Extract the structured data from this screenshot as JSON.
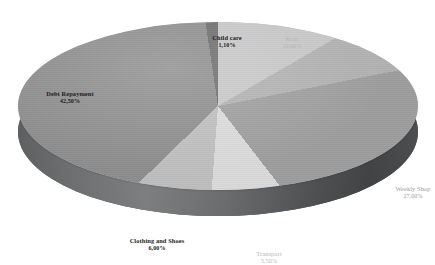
{
  "chart_data": {
    "type": "pie",
    "title": "",
    "subtitle": "",
    "xlabel": "",
    "ylabel": "",
    "style": "3d-exploded-none",
    "legend_position": "none",
    "label_format": "name + percent",
    "grid": false,
    "categories": [
      "Child care",
      "Rent",
      "Utilities",
      "Weekly Shop",
      "Transport",
      "Clothing and Shoes",
      "Debt Repayment"
    ],
    "values": [
      1.1,
      10.0,
      8.0,
      27.0,
      5.5,
      6.0,
      42.5
    ],
    "slices": [
      {
        "label": "Child care",
        "percent_text": "1,10%",
        "value": 1.1,
        "color": "#6b6b6b",
        "label_color": "#1d1d1d",
        "emphasis": "bold"
      },
      {
        "label": "Rent",
        "percent_text": "10,00%",
        "value": 10.0,
        "color": "#c6c6c6",
        "label_color": "#b6b6b6",
        "emphasis": "normal"
      },
      {
        "label": "Utilities",
        "percent_text": "8,00%",
        "value": 8.0,
        "color": "#b0b0b0",
        "label_color": "#b6b6b6",
        "emphasis": "normal"
      },
      {
        "label": "Weekly Shop",
        "percent_text": "27,00%",
        "value": 27.0,
        "color": "#9d9d9d",
        "label_color": "#9a9a9a",
        "emphasis": "normal"
      },
      {
        "label": "Transport",
        "percent_text": "5,50%",
        "value": 5.5,
        "color": "#d9d9d9",
        "label_color": "#b6b6b6",
        "emphasis": "normal"
      },
      {
        "label": "Clothing and Shoes",
        "percent_text": "6,00%",
        "value": 6.0,
        "color": "#bdbdbd",
        "label_color": "#1d1d1d",
        "emphasis": "bold"
      },
      {
        "label": "Debt Repayment",
        "percent_text": "42,50%",
        "value": 42.5,
        "color": "#8c8c8c",
        "label_color": "#1d1d1d",
        "emphasis": "bold"
      }
    ],
    "total_percent": 100.1,
    "background": "#ffffff",
    "side_wall_color": "#6f7173"
  },
  "labels": {
    "childcare": {
      "name": "Child care",
      "percent": "1,10%"
    },
    "rent": {
      "name": "Rent",
      "percent": "10,00%"
    },
    "utilities": {
      "name": "Utilities",
      "percent": "8,00%"
    },
    "weekly": {
      "name": "Weekly Shop",
      "percent": "27,00%"
    },
    "transport": {
      "name": "Transport",
      "percent": "5,50%"
    },
    "clothing": {
      "name": "Clothing and Shoes",
      "percent": "6,00%"
    },
    "debt": {
      "name": "Debt Repayment",
      "percent": "42,50%"
    }
  }
}
